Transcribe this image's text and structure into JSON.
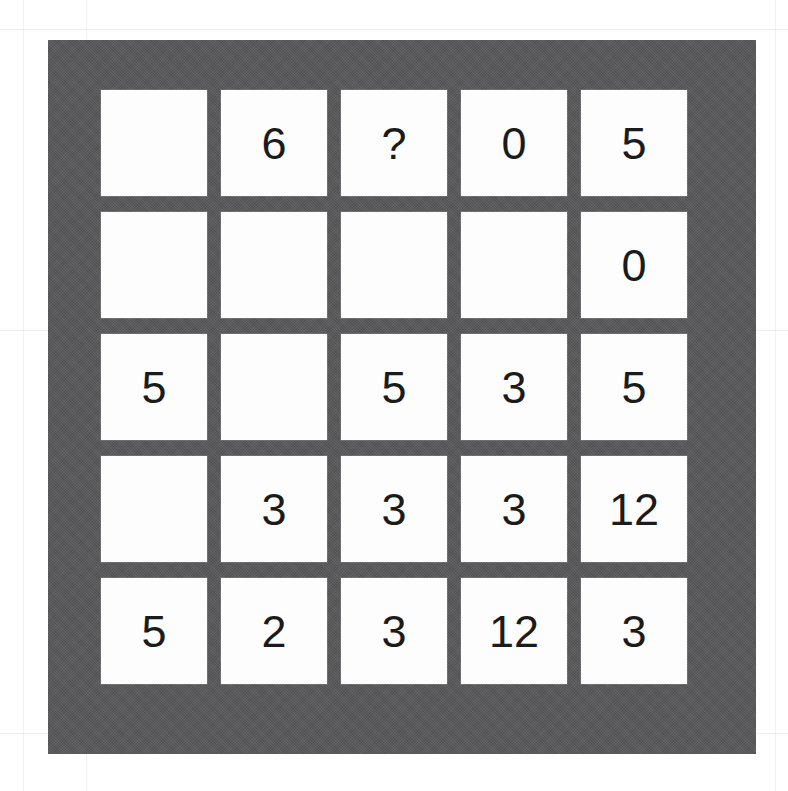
{
  "board": {
    "background_color": "#58585a",
    "cell_color": "#fdfdfd",
    "text_color": "#1b1b1b",
    "rows": 5,
    "columns": 5
  },
  "paper": {
    "background_color": "#ffffff",
    "grid_line_color": "#efefef",
    "vertical_lines": [
      23,
      86,
      775
    ],
    "horizontal_lines": [
      29,
      330,
      733
    ]
  },
  "grid": {
    "rows": [
      {
        "cells": [
          "",
          "6",
          "?",
          "0",
          "5"
        ]
      },
      {
        "cells": [
          "",
          "",
          "",
          "",
          "0"
        ]
      },
      {
        "cells": [
          "5",
          "",
          "5",
          "3",
          "5"
        ]
      },
      {
        "cells": [
          "",
          "3",
          "3",
          "3",
          "12"
        ]
      },
      {
        "cells": [
          "5",
          "2",
          "3",
          "12",
          "3"
        ]
      }
    ]
  }
}
